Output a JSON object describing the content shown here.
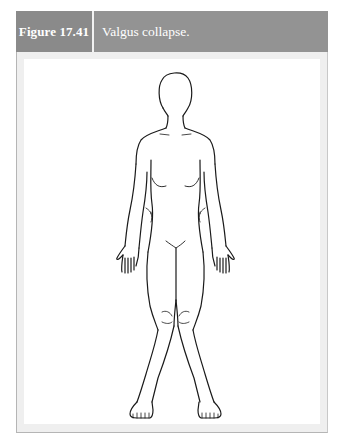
{
  "figure": {
    "label": "Figure 17.41",
    "caption": "Valgus collapse.",
    "illustration": "female-body-front-view-knees-valgus-icon",
    "colors": {
      "header_bg": "#939393",
      "label_bg": "#8a8a8a",
      "header_text": "#ffffff",
      "frame_bg": "#efefef",
      "panel_bg": "#ffffff",
      "line_art": "#1a1a1a"
    }
  }
}
